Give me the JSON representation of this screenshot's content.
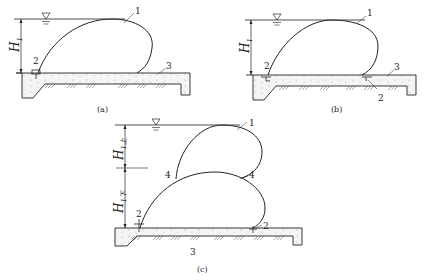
{
  "figure": {
    "panels": [
      {
        "id": "a",
        "caption": "(a)",
        "head_label": "H",
        "head_sub": "1",
        "labels": {
          "membrane": "1",
          "anchor": "2",
          "floor": "3"
        }
      },
      {
        "id": "b",
        "caption": "(b)",
        "head_label": "H",
        "head_sub": "1",
        "labels": {
          "membrane": "1",
          "anchor_left": "2",
          "anchor_right": "2",
          "floor": "3"
        }
      },
      {
        "id": "c",
        "caption": "(c)",
        "head_upper_label": "H",
        "head_upper_sub": "1上",
        "head_lower_label": "H",
        "head_lower_sub": "1下",
        "labels": {
          "upper_membrane": "1",
          "junction_left": "4",
          "junction_right": "4",
          "anchor_left": "2",
          "anchor_right": "2",
          "floor": "3"
        }
      }
    ],
    "water_level_symbol": "▽",
    "colors": {
      "line": "#222222",
      "concrete_fill": "#f3f3f1",
      "background": "#ffffff"
    }
  }
}
